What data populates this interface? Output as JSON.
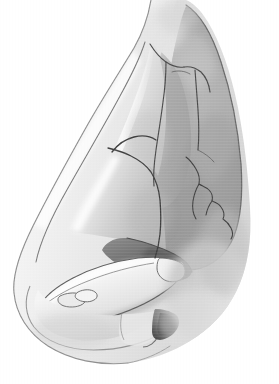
{
  "figure": {
    "domain": "Diagram",
    "kind": "medical-anatomical-illustration",
    "title": "",
    "subject": "nasal skeleton, lateral (profile) view",
    "view": "left lateral / profile",
    "style": "grayscale pencil-and-wash medical illustration, fine crosshatch texture, no text labels",
    "width_px": 279,
    "height_px": 384,
    "has_visible_text": false,
    "label_count": 0,
    "labels": []
  },
  "palette": {
    "background": "#ffffff",
    "outline_stroke": "#4a4a4a",
    "outline_stroke_soft": "#8d8d8d",
    "skin_light": "#f2f2f2",
    "tone_very_light": "#e7e7e7",
    "tone_light": "#d7d7d7",
    "tone_mid_light": "#c2c2c2",
    "tone_mid": "#a8a8a8",
    "tone_mid_dark": "#949494",
    "tone_dark": "#7c7c7c",
    "tone_darker": "#636363",
    "cavity_dark": "#5f5f5f",
    "nostril_dark": "#3f3f3f",
    "highlight": "#fbfbfb"
  },
  "structures": [
    {
      "id": "soft-tissue-profile",
      "name": "soft tissue nasal profile outline",
      "region": "full nose silhouette, left edge dorsum to tip to alar base",
      "tone": "tone_very_light"
    },
    {
      "id": "glabella-nasion",
      "name": "glabella and nasion (nasal root)",
      "region": "top center, x 120-200, y 0-70",
      "tone": "tone_very_light"
    },
    {
      "id": "nasal-bone",
      "name": "nasal bone",
      "region": "upper dorsum wedge, x 100-175, y 55-175",
      "tone": "tone_light"
    },
    {
      "id": "frontal-process-maxilla",
      "name": "frontal process of the maxilla",
      "region": "right of nasal bone, x 150-215, y 60-230",
      "tone": "tone_mid"
    },
    {
      "id": "orbital-rim-maxilla",
      "name": "orbital rim / maxillary body",
      "region": "right lobe, x 175-250, y 15-220",
      "tone": "tone_mid"
    },
    {
      "id": "nasomaxillary-suture",
      "name": "nasomaxillary suture line",
      "region": "irregular line from y 60 descending to y 190 near x 150-175",
      "tone": "outline_stroke"
    },
    {
      "id": "zigzag-suture",
      "name": "descending zigzag suture / fissure",
      "region": "x 185-235, y 155-235",
      "tone": "outline_stroke"
    },
    {
      "id": "upper-lateral-cartilage",
      "name": "upper lateral cartilage",
      "region": "mid dorsum, x 85-175, y 150-245",
      "tone": "tone_mid_light"
    },
    {
      "id": "septal-cartilage",
      "name": "septal cartilage / internal nasal valve",
      "region": "dark triangle, x 110-195, y 215-280",
      "tone": "cavity_dark"
    },
    {
      "id": "lower-lateral-cartilage",
      "name": "lower lateral (alar) cartilage - lateral crus",
      "region": "curving band, x 30-185, y 245-320",
      "tone": "skin_light"
    },
    {
      "id": "medial-crus",
      "name": "medial crus / columella",
      "region": "x 110-170, y 300-345",
      "tone": "tone_light"
    },
    {
      "id": "sesamoid-cartilages",
      "name": "sesamoid / accessory cartilages",
      "region": "small ovals near alar rim, x 45-90, y 290-315",
      "tone": "tone_light"
    },
    {
      "id": "nostril-opening",
      "name": "nostril / nasal vestibule opening",
      "region": "dark wedge, x 150-185, y 308-340",
      "tone": "nostril_dark"
    },
    {
      "id": "alar-lobule",
      "name": "alar lobule and alar base",
      "region": "lower left, x 15-140, y 280-360",
      "tone": "tone_very_light"
    },
    {
      "id": "cheek-shadow",
      "name": "cheek soft tissue shading",
      "region": "right lower, x 175-245, y 230-340",
      "tone": "tone_mid_light"
    }
  ]
}
